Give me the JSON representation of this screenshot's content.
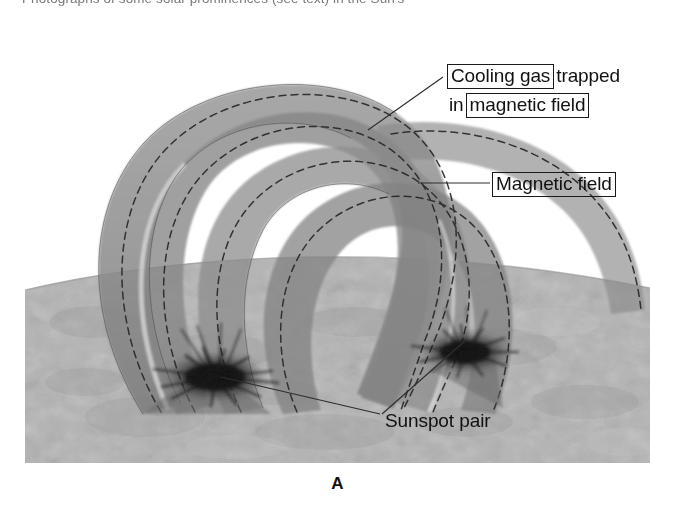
{
  "caption": {
    "top_line": "Photographs of some solar prominences (see text) in the Sun's"
  },
  "figure": {
    "panel_letter": "A",
    "colors": {
      "surface_gray": "#b4b4b4",
      "arch_band_gray": "#8c8c8c",
      "arch_band_shadow": "#787878",
      "sunspot_dark": "#1a1a1a",
      "field_line": "#2b2b2b",
      "leader_line": "#333333",
      "background": "#ffffff"
    }
  },
  "annotations": {
    "cooling_gas": {
      "boxed_part": "Cooling gas",
      "plain_part": "trapped",
      "line2_prefix": "in",
      "line2_boxed": "magnetic field"
    },
    "magnetic_field": {
      "label": "Magnetic field"
    },
    "sunspot_pair": {
      "label": "Sunspot pair"
    }
  }
}
